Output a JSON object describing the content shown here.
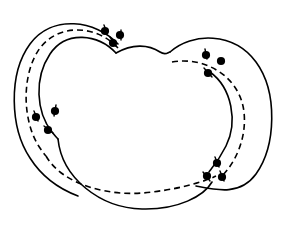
{
  "figure": {
    "title": "Two overlapping crescent bands with dashed core curves and marked boundary points",
    "kind": "topological-diagram",
    "background_color": "#ffffff",
    "ink_color": "#000000",
    "canvas": {
      "width": 288,
      "height": 228
    },
    "stroke": {
      "solid_width": 1.6,
      "dashed_width": 1.6,
      "dash_pattern": "6 4",
      "dot_radius": 4.1
    }
  },
  "chart_data": {
    "type": "diagram",
    "title": "Two overlapping crescent bands with dashed core curves and marked boundary points",
    "xlabel": "",
    "ylabel": "",
    "xlim": [
      0,
      288
    ],
    "ylim": [
      0,
      228
    ],
    "grid": false,
    "legend": "none",
    "curves": [
      {
        "name": "left-band-outer-boundary",
        "style": "solid",
        "path": "M 118 44 C 96 20 52 14 30 44 C 8 74 10 128 30 158 C 44 180 62 190 78 196"
      },
      {
        "name": "left-band-inner-boundary",
        "style": "solid",
        "path": "M 116 53 C 98 34 66 30 50 54 C 34 78 36 112 52 132 C 56 137 58 139 58 139"
      },
      {
        "name": "left-band-core-dashed",
        "style": "dashed",
        "path": "M 118 48 C 98 26 60 22 40 48 C 21 74 22 122 40 148 C 44 154 46 156 46 156"
      },
      {
        "name": "right-band-outer-boundary",
        "style": "solid",
        "path": "M 170 52 C 192 32 234 32 256 62 C 278 92 276 146 256 174 C 240 196 216 190 196 186"
      },
      {
        "name": "right-band-inner-boundary",
        "style": "solid",
        "path": "M 210 72 C 232 88 238 122 226 146 C 219 160 212 168 209 172"
      },
      {
        "name": "right-band-core-dashed",
        "style": "dashed",
        "path": "M 172 62 C 204 56 240 76 244 112 C 247 140 234 164 222 176"
      },
      {
        "name": "central-lobe-bottom-boundary",
        "style": "solid",
        "path": "M 58 139 C 62 178 100 208 142 209 C 178 210 204 196 212 182"
      },
      {
        "name": "central-lobe-top-boundary",
        "style": "solid",
        "path": "M 116 53 C 132 44 148 44 160 52 C 166 56 168 52 170 52"
      },
      {
        "name": "central-core-dashed",
        "style": "dashed",
        "path": "M 46 156 C 62 184 108 198 152 192 C 186 188 208 180 216 176"
      }
    ],
    "points": [
      {
        "name": "p1",
        "x": 105,
        "y": 31,
        "cluster": "top-left"
      },
      {
        "name": "p2",
        "x": 120,
        "y": 35,
        "cluster": "top-left"
      },
      {
        "name": "p3",
        "x": 113,
        "y": 43,
        "cluster": "top-left"
      },
      {
        "name": "p4",
        "x": 36,
        "y": 117,
        "cluster": "left"
      },
      {
        "name": "p5",
        "x": 55,
        "y": 111,
        "cluster": "left"
      },
      {
        "name": "p6",
        "x": 48,
        "y": 130,
        "cluster": "left"
      },
      {
        "name": "p7",
        "x": 206,
        "y": 55,
        "cluster": "top-right"
      },
      {
        "name": "p8",
        "x": 221,
        "y": 61,
        "cluster": "top-right"
      },
      {
        "name": "p9",
        "x": 208,
        "y": 73,
        "cluster": "top-right"
      },
      {
        "name": "p10",
        "x": 217,
        "y": 163,
        "cluster": "bottom-right"
      },
      {
        "name": "p11",
        "x": 207,
        "y": 176,
        "cluster": "bottom-right"
      },
      {
        "name": "p12",
        "x": 222,
        "y": 177,
        "cluster": "bottom-right"
      }
    ],
    "tick_marks": [
      {
        "name": "t1",
        "x1": 104,
        "y1": 25,
        "x2": 107,
        "y2": 33
      },
      {
        "name": "t2",
        "x1": 121,
        "y1": 30,
        "x2": 121,
        "y2": 40
      },
      {
        "name": "t3",
        "x1": 110,
        "y1": 37,
        "x2": 116,
        "y2": 46
      },
      {
        "name": "t4",
        "x1": 34,
        "y1": 111,
        "x2": 38,
        "y2": 121
      },
      {
        "name": "t5",
        "x1": 56,
        "y1": 105,
        "x2": 54,
        "y2": 116
      },
      {
        "name": "t6",
        "x1": 44,
        "y1": 126,
        "x2": 53,
        "y2": 133
      },
      {
        "name": "t7",
        "x1": 205,
        "y1": 49,
        "x2": 207,
        "y2": 59
      },
      {
        "name": "t8",
        "x1": 204,
        "y1": 68,
        "x2": 212,
        "y2": 77
      },
      {
        "name": "t9",
        "x1": 215,
        "y1": 157,
        "x2": 219,
        "y2": 167
      },
      {
        "name": "t10",
        "x1": 203,
        "y1": 172,
        "x2": 210,
        "y2": 181
      },
      {
        "name": "t11",
        "x1": 220,
        "y1": 171,
        "x2": 224,
        "y2": 181
      }
    ]
  }
}
